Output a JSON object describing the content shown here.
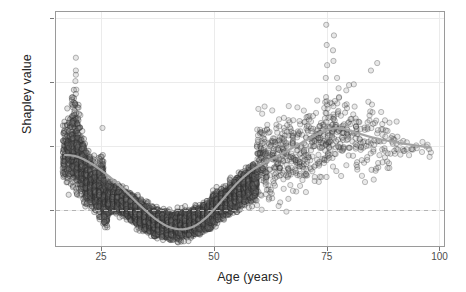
{
  "chart_data": {
    "type": "scatter",
    "title": "",
    "xlabel": "Age (years)",
    "ylabel": "Shapley value",
    "xlim": [
      15,
      101
    ],
    "ylim": [
      -0.17,
      0.93
    ],
    "xticks": [
      25,
      50,
      75,
      100
    ],
    "xtick_labels": [
      "25",
      "50",
      "75",
      "100"
    ],
    "yticks": [
      0.0,
      0.3,
      0.6,
      0.9
    ],
    "ytick_labels": [
      "0.0",
      "0.3",
      "0.6",
      "0.9"
    ],
    "grid": true,
    "grid_color": "#ebebeb",
    "legend": "none",
    "point_shape": "open-circle",
    "point_radius_px": 2.6,
    "point_stroke_color": "#3c3c3c",
    "point_fill_color": "#808080",
    "point_opacity": 0.3,
    "panel_border_color": "#9a9a9a",
    "background_color": "#ffffff",
    "annotations": [
      {
        "kind": "hline",
        "y": 0.0,
        "style": "dashed",
        "color": "#b4b4b4",
        "label": "zero reference line"
      }
    ],
    "series": [
      {
        "name": "Shapley values by age",
        "description": "Dense band of per-individual Shapley values; very dark (high overplotting) below age 60, sparse gray circles above age 60.",
        "n_points_approx": 4200,
        "density_profile": [
          {
            "age": 17,
            "n": 26,
            "center": 0.27,
            "spread": 0.14
          },
          {
            "age": 18,
            "n": 34,
            "center": 0.28,
            "spread": 0.16
          },
          {
            "age": 19,
            "n": 46,
            "center": 0.3,
            "spread": 0.19
          },
          {
            "age": 20,
            "n": 60,
            "center": 0.26,
            "spread": 0.16
          },
          {
            "age": 21,
            "n": 70,
            "center": 0.2,
            "spread": 0.12
          },
          {
            "age": 22,
            "n": 76,
            "center": 0.15,
            "spread": 0.1
          },
          {
            "age": 23,
            "n": 80,
            "center": 0.12,
            "spread": 0.09
          },
          {
            "age": 24,
            "n": 84,
            "center": 0.1,
            "spread": 0.08
          },
          {
            "age": 25,
            "n": 88,
            "center": 0.12,
            "spread": 0.12
          },
          {
            "age": 26,
            "n": 88,
            "center": 0.04,
            "spread": 0.09
          },
          {
            "age": 27,
            "n": 90,
            "center": 0.055,
            "spread": 0.055
          },
          {
            "age": 28,
            "n": 90,
            "center": 0.05,
            "spread": 0.05
          },
          {
            "age": 29,
            "n": 92,
            "center": 0.045,
            "spread": 0.05
          },
          {
            "age": 30,
            "n": 92,
            "center": 0.035,
            "spread": 0.05
          },
          {
            "age": 31,
            "n": 94,
            "center": 0.02,
            "spread": 0.05
          },
          {
            "age": 32,
            "n": 94,
            "center": 0.005,
            "spread": 0.05
          },
          {
            "age": 33,
            "n": 96,
            "center": -0.01,
            "spread": 0.05
          },
          {
            "age": 34,
            "n": 96,
            "center": -0.025,
            "spread": 0.05
          },
          {
            "age": 35,
            "n": 98,
            "center": -0.04,
            "spread": 0.05
          },
          {
            "age": 36,
            "n": 98,
            "center": -0.05,
            "spread": 0.05
          },
          {
            "age": 37,
            "n": 100,
            "center": -0.06,
            "spread": 0.05
          },
          {
            "age": 38,
            "n": 100,
            "center": -0.065,
            "spread": 0.05
          },
          {
            "age": 39,
            "n": 102,
            "center": -0.07,
            "spread": 0.05
          },
          {
            "age": 40,
            "n": 102,
            "center": -0.072,
            "spread": 0.05
          },
          {
            "age": 41,
            "n": 104,
            "center": -0.075,
            "spread": 0.05
          },
          {
            "age": 42,
            "n": 104,
            "center": -0.073,
            "spread": 0.05
          },
          {
            "age": 43,
            "n": 104,
            "center": -0.07,
            "spread": 0.05
          },
          {
            "age": 44,
            "n": 104,
            "center": -0.065,
            "spread": 0.05
          },
          {
            "age": 45,
            "n": 104,
            "center": -0.058,
            "spread": 0.05
          },
          {
            "age": 46,
            "n": 104,
            "center": -0.05,
            "spread": 0.05
          },
          {
            "age": 47,
            "n": 102,
            "center": -0.042,
            "spread": 0.05
          },
          {
            "age": 48,
            "n": 102,
            "center": -0.035,
            "spread": 0.05
          },
          {
            "age": 49,
            "n": 100,
            "center": -0.028,
            "spread": 0.05
          },
          {
            "age": 50,
            "n": 98,
            "center": 0.005,
            "spread": 0.055
          },
          {
            "age": 51,
            "n": 96,
            "center": 0.015,
            "spread": 0.055
          },
          {
            "age": 52,
            "n": 94,
            "center": 0.03,
            "spread": 0.055
          },
          {
            "age": 53,
            "n": 92,
            "center": 0.045,
            "spread": 0.055
          },
          {
            "age": 54,
            "n": 88,
            "center": 0.06,
            "spread": 0.06
          },
          {
            "age": 55,
            "n": 84,
            "center": 0.075,
            "spread": 0.06
          },
          {
            "age": 56,
            "n": 80,
            "center": 0.09,
            "spread": 0.06
          },
          {
            "age": 57,
            "n": 74,
            "center": 0.105,
            "spread": 0.06
          },
          {
            "age": 58,
            "n": 68,
            "center": 0.12,
            "spread": 0.065
          },
          {
            "age": 59,
            "n": 60,
            "center": 0.135,
            "spread": 0.07
          },
          {
            "age": 60,
            "n": 54,
            "center": 0.25,
            "spread": 0.2
          },
          {
            "age": 61,
            "n": 40,
            "center": 0.25,
            "spread": 0.19
          },
          {
            "age": 62,
            "n": 34,
            "center": 0.24,
            "spread": 0.19
          },
          {
            "age": 63,
            "n": 30,
            "center": 0.23,
            "spread": 0.18
          },
          {
            "age": 64,
            "n": 28,
            "center": 0.24,
            "spread": 0.18
          },
          {
            "age": 65,
            "n": 28,
            "center": 0.25,
            "spread": 0.19
          },
          {
            "age": 66,
            "n": 26,
            "center": 0.25,
            "spread": 0.18
          },
          {
            "age": 67,
            "n": 26,
            "center": 0.26,
            "spread": 0.18
          },
          {
            "age": 68,
            "n": 26,
            "center": 0.27,
            "spread": 0.18
          },
          {
            "age": 69,
            "n": 24,
            "center": 0.27,
            "spread": 0.18
          },
          {
            "age": 70,
            "n": 24,
            "center": 0.28,
            "spread": 0.18
          },
          {
            "age": 71,
            "n": 22,
            "center": 0.29,
            "spread": 0.18
          },
          {
            "age": 72,
            "n": 22,
            "center": 0.3,
            "spread": 0.18
          },
          {
            "age": 73,
            "n": 22,
            "center": 0.31,
            "spread": 0.18
          },
          {
            "age": 74,
            "n": 24,
            "center": 0.33,
            "spread": 0.19
          },
          {
            "age": 75,
            "n": 30,
            "center": 0.37,
            "spread": 0.22
          },
          {
            "age": 76,
            "n": 26,
            "center": 0.38,
            "spread": 0.2
          },
          {
            "age": 77,
            "n": 22,
            "center": 0.38,
            "spread": 0.19
          },
          {
            "age": 78,
            "n": 20,
            "center": 0.38,
            "spread": 0.18
          },
          {
            "age": 79,
            "n": 18,
            "center": 0.37,
            "spread": 0.18
          },
          {
            "age": 80,
            "n": 16,
            "center": 0.35,
            "spread": 0.17
          },
          {
            "age": 81,
            "n": 14,
            "center": 0.34,
            "spread": 0.16
          },
          {
            "age": 82,
            "n": 14,
            "center": 0.33,
            "spread": 0.16
          },
          {
            "age": 83,
            "n": 13,
            "center": 0.33,
            "spread": 0.15
          },
          {
            "age": 84,
            "n": 12,
            "center": 0.33,
            "spread": 0.15
          },
          {
            "age": 85,
            "n": 12,
            "center": 0.33,
            "spread": 0.15
          },
          {
            "age": 86,
            "n": 11,
            "center": 0.33,
            "spread": 0.14
          },
          {
            "age": 87,
            "n": 10,
            "center": 0.33,
            "spread": 0.13
          },
          {
            "age": 88,
            "n": 9,
            "center": 0.32,
            "spread": 0.13
          },
          {
            "age": 89,
            "n": 8,
            "center": 0.32,
            "spread": 0.12
          },
          {
            "age": 90,
            "n": 7,
            "center": 0.31,
            "spread": 0.11
          },
          {
            "age": 91,
            "n": 5,
            "center": 0.31,
            "spread": 0.09
          },
          {
            "age": 92,
            "n": 4,
            "center": 0.31,
            "spread": 0.07
          },
          {
            "age": 93,
            "n": 3,
            "center": 0.31,
            "spread": 0.06
          },
          {
            "age": 94,
            "n": 3,
            "center": 0.3,
            "spread": 0.05
          },
          {
            "age": 95,
            "n": 2,
            "center": 0.3,
            "spread": 0.05
          },
          {
            "age": 96,
            "n": 2,
            "center": 0.3,
            "spread": 0.04
          },
          {
            "age": 97,
            "n": 2,
            "center": 0.3,
            "spread": 0.04
          },
          {
            "age": 98,
            "n": 3,
            "center": 0.29,
            "spread": 0.04
          }
        ],
        "outliers": [
          {
            "age": 19.4,
            "value": 0.715
          },
          {
            "age": 19.4,
            "value": 0.655
          },
          {
            "age": 19.4,
            "value": 0.635
          },
          {
            "age": 19.3,
            "value": 0.605
          },
          {
            "age": 19.5,
            "value": 0.565
          },
          {
            "age": 19.4,
            "value": 0.545
          },
          {
            "age": 19.2,
            "value": 0.5
          },
          {
            "age": 20.0,
            "value": 0.48
          },
          {
            "age": 19.0,
            "value": 0.455
          },
          {
            "age": 20.4,
            "value": 0.445
          },
          {
            "age": 18.6,
            "value": 0.41
          },
          {
            "age": 19.8,
            "value": 0.405
          },
          {
            "age": 18.4,
            "value": 0.355
          },
          {
            "age": 25.3,
            "value": 0.385
          },
          {
            "age": 74.9,
            "value": 0.87
          },
          {
            "age": 76.6,
            "value": 0.82
          },
          {
            "age": 75.0,
            "value": 0.775
          },
          {
            "age": 76.4,
            "value": 0.75
          },
          {
            "age": 76.5,
            "value": 0.7
          },
          {
            "age": 75.1,
            "value": 0.68
          },
          {
            "age": 86.2,
            "value": 0.69
          },
          {
            "age": 84.8,
            "value": 0.655
          },
          {
            "age": 74.8,
            "value": 0.62
          },
          {
            "age": 77.3,
            "value": 0.62
          },
          {
            "age": 81.0,
            "value": 0.59
          },
          {
            "age": 90.5,
            "value": 0.415
          }
        ]
      }
    ],
    "trend_line": {
      "name": "smoothed trend (loess)",
      "color": "#a3a3a3",
      "width_px": 2.2,
      "points": [
        [
          17.0,
          0.258
        ],
        [
          18.0,
          0.257
        ],
        [
          19.0,
          0.254
        ],
        [
          20.0,
          0.248
        ],
        [
          21.0,
          0.239
        ],
        [
          22.0,
          0.228
        ],
        [
          23.0,
          0.215
        ],
        [
          24.0,
          0.201
        ],
        [
          25.0,
          0.186
        ],
        [
          26.0,
          0.17
        ],
        [
          27.0,
          0.153
        ],
        [
          28.0,
          0.135
        ],
        [
          29.0,
          0.116
        ],
        [
          30.0,
          0.096
        ],
        [
          31.0,
          0.075
        ],
        [
          32.0,
          0.054
        ],
        [
          33.0,
          0.033
        ],
        [
          34.0,
          0.013
        ],
        [
          35.0,
          -0.006
        ],
        [
          36.0,
          -0.025
        ],
        [
          37.0,
          -0.042
        ],
        [
          38.0,
          -0.057
        ],
        [
          39.0,
          -0.07
        ],
        [
          40.0,
          -0.08
        ],
        [
          41.0,
          -0.087
        ],
        [
          42.0,
          -0.091
        ],
        [
          43.0,
          -0.092
        ],
        [
          44.0,
          -0.089
        ],
        [
          45.0,
          -0.083
        ],
        [
          46.0,
          -0.073
        ],
        [
          47.0,
          -0.059
        ],
        [
          48.0,
          -0.042
        ],
        [
          49.0,
          -0.022
        ],
        [
          50.0,
          0.001
        ],
        [
          51.0,
          0.025
        ],
        [
          52.0,
          0.05
        ],
        [
          53.0,
          0.075
        ],
        [
          54.0,
          0.099
        ],
        [
          55.0,
          0.122
        ],
        [
          56.0,
          0.143
        ],
        [
          57.0,
          0.162
        ],
        [
          58.0,
          0.179
        ],
        [
          59.0,
          0.194
        ],
        [
          60.0,
          0.207
        ],
        [
          61.0,
          0.219
        ],
        [
          62.0,
          0.23
        ],
        [
          63.0,
          0.241
        ],
        [
          64.0,
          0.252
        ],
        [
          65.0,
          0.263
        ],
        [
          66.0,
          0.274
        ],
        [
          67.0,
          0.286
        ],
        [
          68.0,
          0.298
        ],
        [
          69.0,
          0.31
        ],
        [
          70.0,
          0.322
        ],
        [
          71.0,
          0.334
        ],
        [
          72.0,
          0.346
        ],
        [
          73.0,
          0.357
        ],
        [
          74.0,
          0.367
        ],
        [
          75.0,
          0.375
        ],
        [
          76.0,
          0.381
        ],
        [
          77.0,
          0.384
        ],
        [
          78.0,
          0.383
        ],
        [
          79.0,
          0.379
        ],
        [
          80.0,
          0.373
        ],
        [
          81.0,
          0.366
        ],
        [
          82.0,
          0.359
        ],
        [
          83.0,
          0.353
        ],
        [
          84.0,
          0.347
        ],
        [
          85.0,
          0.341
        ],
        [
          86.0,
          0.336
        ],
        [
          87.0,
          0.331
        ],
        [
          88.0,
          0.327
        ],
        [
          89.0,
          0.323
        ],
        [
          90.0,
          0.319
        ],
        [
          91.0,
          0.315
        ],
        [
          92.0,
          0.311
        ],
        [
          93.0,
          0.308
        ],
        [
          94.0,
          0.305
        ],
        [
          95.0,
          0.302
        ],
        [
          96.0,
          0.299
        ],
        [
          97.0,
          0.296
        ],
        [
          98.0,
          0.293
        ]
      ]
    }
  }
}
